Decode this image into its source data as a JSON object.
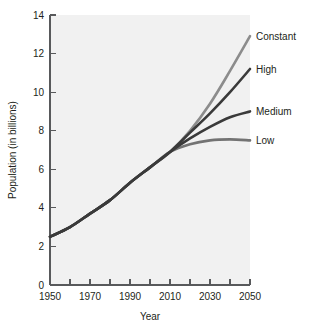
{
  "chart_data": {
    "type": "line",
    "title": "",
    "xlabel": "Year",
    "ylabel": "Population (in billions)",
    "xlim": [
      1950,
      2050
    ],
    "ylim": [
      0,
      14
    ],
    "grid": false,
    "legend_position": "right-of-plot-at-line-ends",
    "x_ticks_major": [
      1950,
      1970,
      1990,
      2010,
      2030,
      2050
    ],
    "x_ticks_minor": [
      1960,
      1980,
      2000,
      2020,
      2040
    ],
    "x_tick_labels": [
      "1950",
      "1970",
      "1990",
      "2010",
      "2030",
      "2050"
    ],
    "y_ticks": [
      0,
      2,
      4,
      6,
      8,
      10,
      12,
      14
    ],
    "y_tick_labels": [
      "0",
      "2",
      "4",
      "6",
      "8",
      "10",
      "12",
      "14"
    ],
    "x": [
      1950,
      1960,
      1970,
      1980,
      1990,
      2000,
      2010,
      2020,
      2030,
      2040,
      2050
    ],
    "series": [
      {
        "name": "Constant",
        "color": "#8c8c8c",
        "values": [
          2.5,
          3.0,
          3.7,
          4.4,
          5.3,
          6.1,
          6.9,
          8.0,
          9.4,
          11.1,
          12.9
        ]
      },
      {
        "name": "High",
        "color": "#3a3a3a",
        "values": [
          2.5,
          3.0,
          3.7,
          4.4,
          5.3,
          6.1,
          6.9,
          7.9,
          8.9,
          10.0,
          11.2
        ]
      },
      {
        "name": "Medium",
        "color": "#3a3a3a",
        "values": [
          2.5,
          3.0,
          3.7,
          4.4,
          5.3,
          6.1,
          6.9,
          7.6,
          8.2,
          8.7,
          9.0
        ]
      },
      {
        "name": "Low",
        "color": "#737373",
        "values": [
          2.5,
          3.0,
          3.7,
          4.4,
          5.3,
          6.1,
          6.9,
          7.3,
          7.5,
          7.55,
          7.5
        ]
      }
    ]
  },
  "colors": {
    "plot_background": "#f1f1f1",
    "axis": "#58595b",
    "text": "#231f20"
  }
}
